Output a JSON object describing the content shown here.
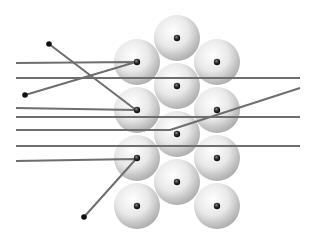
{
  "diagram": {
    "colors": {
      "background": "#ffffff",
      "line": "#6e6e6e",
      "sphere_light": "#ffffff",
      "sphere_mid": "#e6e6e6",
      "sphere_dark": "#b4b4b4",
      "nucleus": "#222222",
      "endpoint_dot": "#111111"
    },
    "sphere_radius": 23,
    "spheres": [
      {
        "cx": 177,
        "cy": 38
      },
      {
        "cx": 137,
        "cy": 62
      },
      {
        "cx": 217,
        "cy": 62
      },
      {
        "cx": 177,
        "cy": 86
      },
      {
        "cx": 137,
        "cy": 110
      },
      {
        "cx": 217,
        "cy": 110
      },
      {
        "cx": 177,
        "cy": 134
      },
      {
        "cx": 137,
        "cy": 158
      },
      {
        "cx": 217,
        "cy": 158
      },
      {
        "cx": 177,
        "cy": 182
      },
      {
        "cx": 137,
        "cy": 206
      },
      {
        "cx": 217,
        "cy": 206
      }
    ],
    "paths": [
      {
        "name": "straight-line-1",
        "points": "16,78 300,78"
      },
      {
        "name": "straight-line-2",
        "points": "16,117 300,117"
      },
      {
        "name": "straight-line-3",
        "points": "16,146 300,146"
      },
      {
        "name": "deflected-line-upper-a",
        "points": "16,63 136,62 25,95"
      },
      {
        "name": "deflected-line-upper-b",
        "points": "16,108 136,110 49,44"
      },
      {
        "name": "deflected-line-middle",
        "points": "16,130 170,130 300,88"
      },
      {
        "name": "deflected-line-lower",
        "points": "16,161 136,159 84,217"
      }
    ],
    "endpoints": [
      {
        "cx": 49,
        "cy": 44
      },
      {
        "cx": 25,
        "cy": 95
      },
      {
        "cx": 84,
        "cy": 217
      }
    ]
  }
}
